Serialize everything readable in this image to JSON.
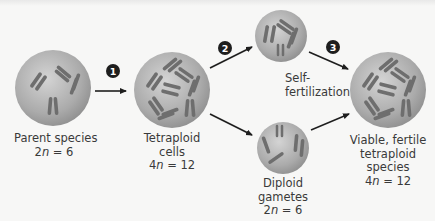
{
  "stages": {
    "parent": {
      "name": "Parent species",
      "formula_prefix": "2",
      "formula_var": "n",
      "formula_rest": " = 6"
    },
    "tetraploid_cells": {
      "line1": "Tetraploid",
      "line2": "cells",
      "formula_prefix": "4",
      "formula_var": "n",
      "formula_rest": " = 12"
    },
    "self_fertilization": {
      "line1": "Self-",
      "line2": "fertilization"
    },
    "diploid_gametes": {
      "line1": "Diploid",
      "line2": "gametes",
      "formula_prefix": "2",
      "formula_var": "n",
      "formula_rest": " = 6"
    },
    "viable_species": {
      "line1": "Viable, fertile",
      "line2": "tetraploid",
      "line3": "species",
      "formula_prefix": "4",
      "formula_var": "n",
      "formula_rest": " = 12"
    }
  },
  "steps": [
    "1",
    "2",
    "3"
  ],
  "colors": {
    "cell_fill": "#a9a9a9",
    "cell_highlight": "#d2d2d2",
    "chromosome": "#6a6a6a",
    "arrow": "#1e1e1e",
    "step_badge": "#1e1e1e"
  }
}
